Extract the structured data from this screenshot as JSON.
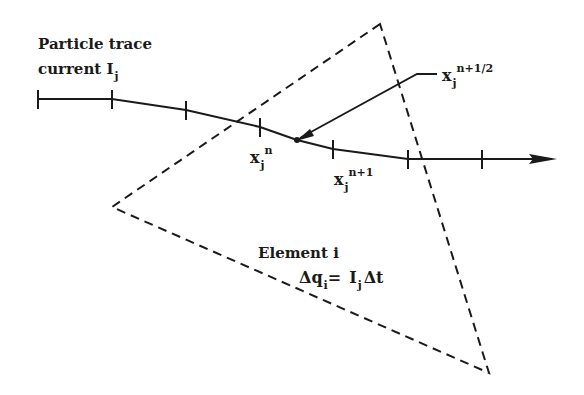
{
  "diagram": {
    "title_line1": "Particle trace",
    "title_line2_prefix": "current I",
    "title_line2_sub": "j",
    "element_label": "Element i",
    "charge_eq": {
      "lhs": "Δq",
      "lhs_sub": "i",
      "eq": "=",
      "rhs_I": "I",
      "rhs_sub": "j",
      "rhs_dt": "Δt"
    },
    "points": [
      {
        "base": "x",
        "sub": "j",
        "sup": "n"
      },
      {
        "base": "x",
        "sub": "j",
        "sup": "n+1"
      },
      {
        "base": "x",
        "sub": "j",
        "sup": "n+1/2"
      }
    ],
    "colors": {
      "stroke": "#1a1a1a",
      "background": "#ffffff"
    },
    "geometry": {
      "triangle": [
        [
          380,
          24
        ],
        [
          112,
          207
        ],
        [
          489,
          373
        ]
      ],
      "trace": [
        [
          38,
          99
        ],
        [
          112,
          99
        ],
        [
          186,
          110
        ],
        [
          260,
          127
        ],
        [
          297,
          140
        ],
        [
          333,
          149
        ],
        [
          408,
          159
        ],
        [
          482,
          159
        ],
        [
          556,
          159
        ]
      ],
      "ticks": [
        [
          38,
          99
        ],
        [
          112,
          99
        ],
        [
          186,
          110
        ],
        [
          260,
          127
        ],
        [
          333,
          149
        ],
        [
          408,
          159
        ],
        [
          482,
          159
        ]
      ],
      "midpoint_dot": [
        297,
        140
      ],
      "leader": [
        [
          297,
          140
        ],
        [
          417,
          74
        ],
        [
          437,
          74
        ]
      ]
    }
  }
}
